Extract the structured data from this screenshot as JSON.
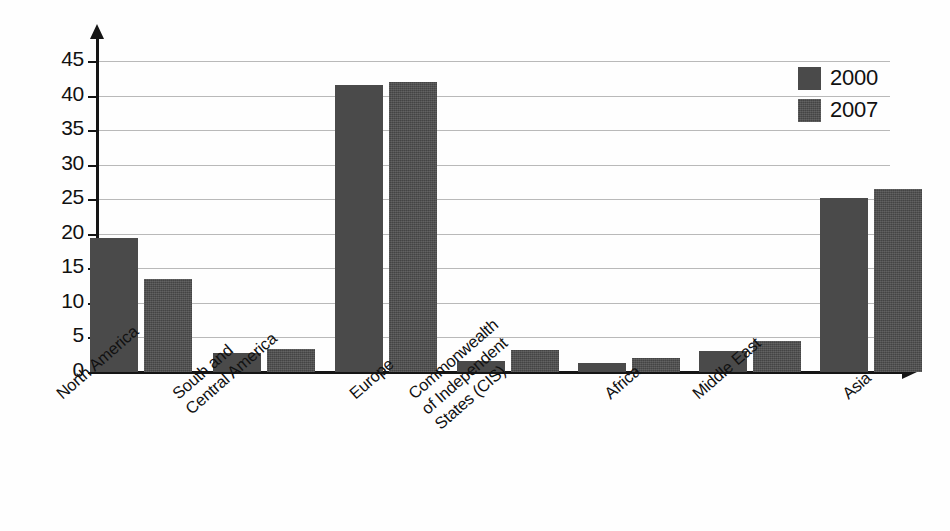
{
  "chart_data": {
    "type": "bar",
    "title": "",
    "subtitle": "",
    "xlabel": "",
    "ylabel": "",
    "ylim": [
      0,
      45
    ],
    "ytick_labels": [
      "0",
      "5",
      "10",
      "15",
      "20",
      "25",
      "30",
      "35",
      "40",
      "45"
    ],
    "ytick_values": [
      0,
      5,
      10,
      15,
      20,
      25,
      30,
      35,
      40,
      45
    ],
    "grid": true,
    "legend_position": "top-right",
    "categories": [
      "North America",
      "South and\nCentral America",
      "Europe",
      "Commonwealth\nof Independent\nStates (CIS)",
      "Africa",
      "Middle East",
      "Asia"
    ],
    "series": [
      {
        "name": "2000",
        "color": "#4a4a4a",
        "values": [
          19.4,
          2.7,
          41.6,
          1.6,
          1.3,
          3.1,
          25.2
        ]
      },
      {
        "name": "2007",
        "color": "#4d4d4d",
        "values": [
          13.4,
          3.4,
          42.0,
          3.2,
          2.1,
          4.5,
          26.5
        ]
      }
    ]
  },
  "legend": {
    "entries": [
      {
        "label": "2000",
        "swatch": "legend-swatch-2000"
      },
      {
        "label": "2007",
        "swatch": "legend-swatch-2007"
      }
    ]
  },
  "axes": {
    "y_arrow": "y-axis-arrow-icon",
    "x_arrow": "x-axis-arrow-icon"
  }
}
